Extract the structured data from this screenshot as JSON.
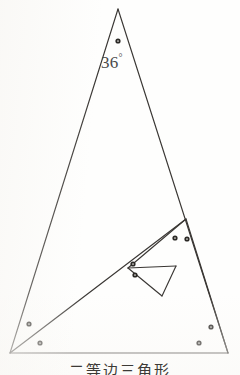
{
  "figure": {
    "caption": "二等边三角形",
    "apex_angle_label": "36",
    "degree_symbol": "°",
    "stroke_color": "#3a3734",
    "background_color": "#fefefd",
    "dot_color": "#2b2926",
    "stroke_width": 1.15,
    "vertices": {
      "apex": {
        "x": 118,
        "y": 9
      },
      "base_left": {
        "x": 10,
        "y": 353
      },
      "base_right": {
        "x": 228,
        "y": 353
      },
      "level2_right": {
        "x": 186,
        "y": 219
      },
      "level3_left": {
        "x": 128,
        "y": 268
      },
      "level4_bottom": {
        "x": 162,
        "y": 296
      },
      "level4_right": {
        "x": 176,
        "y": 266
      }
    },
    "segments": [
      {
        "name": "left-leg",
        "from": "apex",
        "to": "base_left"
      },
      {
        "name": "right-leg",
        "from": "apex",
        "to": "base_right"
      },
      {
        "name": "base",
        "from": "base_left",
        "to": "base_right"
      },
      {
        "name": "bisector-1",
        "from": "base_left",
        "to": "level2_right"
      },
      {
        "name": "bisector-2",
        "from": "level2_right",
        "to": "base_right"
      },
      {
        "name": "bisector-3",
        "from": "level2_right",
        "to": "level3_left"
      },
      {
        "name": "bisector-4",
        "from": "level3_left",
        "to": "level4_bottom"
      },
      {
        "name": "bisector-5",
        "from": "level3_left",
        "to": "level4_right"
      },
      {
        "name": "bisector-6",
        "from": "level4_right",
        "to": "level4_bottom"
      }
    ],
    "angle_dots": [
      {
        "name": "apex-dot",
        "x": 118,
        "y": 41,
        "count": 1
      },
      {
        "name": "base-left-upper-dot",
        "x": 29,
        "y": 324,
        "count": 1
      },
      {
        "name": "base-left-lower-dot",
        "x": 40,
        "y": 343,
        "count": 1
      },
      {
        "name": "base-right-upper-dot",
        "x": 211,
        "y": 327,
        "count": 1
      },
      {
        "name": "base-right-lower-dot",
        "x": 199,
        "y": 343,
        "count": 1
      },
      {
        "name": "level2-left-dot",
        "x": 175,
        "y": 238,
        "count": 1
      },
      {
        "name": "level2-right-dot",
        "x": 187,
        "y": 239,
        "count": 1
      },
      {
        "name": "level3-upper-dot",
        "x": 133,
        "y": 264,
        "count": 1
      },
      {
        "name": "level3-lower-dot",
        "x": 135,
        "y": 275,
        "count": 1
      }
    ]
  }
}
